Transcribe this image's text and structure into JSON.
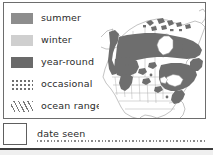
{
  "figure": {
    "kind": "range-map-legend"
  },
  "legend": {
    "items": [
      {
        "key": "summer",
        "label": "summer",
        "swatch": "solid-fill-swatch",
        "color": "#8d8d8d"
      },
      {
        "key": "winter",
        "label": "winter",
        "swatch": "solid-fill-swatch",
        "color": "#cfcfcf"
      },
      {
        "key": "year-round",
        "label": "year-round",
        "swatch": "solid-fill-swatch",
        "color": "#6a6a6a"
      },
      {
        "key": "occasional",
        "label": "occasional",
        "swatch": "dotted-fill-swatch",
        "color": "#6f6f6f"
      },
      {
        "key": "ocean-range",
        "label": "ocean range",
        "swatch": "hatched-fill-swatch",
        "color": "#7a7a7a"
      }
    ]
  },
  "date_seen": {
    "label": "date seen",
    "value": "",
    "placeholder": ""
  },
  "map": {
    "title": "",
    "region": "North America",
    "shading_color": "#6e6e6e",
    "outline_color": "#8c8c8c",
    "border_color": "#6d6d6d"
  },
  "colors": {
    "frame": "#6d6d6d",
    "text": "#2b2b2b",
    "rule": "#3c3c3c",
    "page_background": "#ffffff"
  }
}
